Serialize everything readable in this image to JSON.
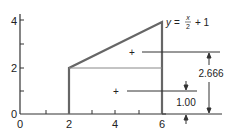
{
  "diagram": {
    "x_ticks": [
      "0",
      "2",
      "4",
      "6"
    ],
    "y_ticks": [
      "0",
      "2",
      "4"
    ],
    "equation": {
      "y": "y",
      "eq": "=",
      "num": "x",
      "den": "2",
      "tail": "+ 1"
    },
    "dimensions": {
      "upper": "2.666",
      "lower": "1.00"
    },
    "centroid_marker": "+",
    "colors": {
      "line": "#555555",
      "thin": "#777777",
      "text": "#222222"
    }
  }
}
